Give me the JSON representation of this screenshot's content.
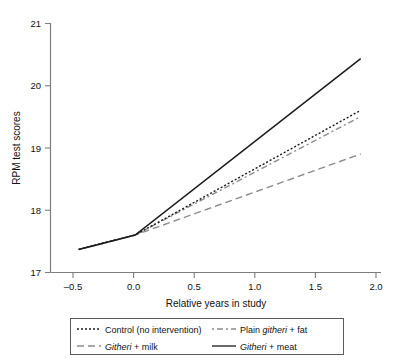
{
  "chart_data": {
    "type": "line",
    "title": "",
    "subtitle": "",
    "xlabel": "Relative years in study",
    "ylabel": "RPM test scores",
    "xlim": [
      -0.75,
      2.18
    ],
    "ylim": [
      17,
      21
    ],
    "xticks": [
      -0.5,
      0.0,
      0.5,
      1.0,
      1.5,
      2.0
    ],
    "xticklabels": [
      "–0.5",
      "0.0",
      "0.5",
      "1.0",
      "1.5",
      "2.0"
    ],
    "yticks": [
      17,
      18,
      19,
      20,
      21
    ],
    "yticklabels": [
      "17",
      "18",
      "19",
      "20",
      "21"
    ],
    "grid": false,
    "legend_position": "below",
    "x": [
      -0.5,
      0.0,
      2.0
    ],
    "series": [
      {
        "name": "Control (no intervention)",
        "values": [
          17.37,
          17.6,
          19.6
        ],
        "style": "dotted",
        "color": "#1a1a1a"
      },
      {
        "name": "Plain githeri + fat",
        "values": [
          17.37,
          17.6,
          19.5
        ],
        "style": "dashdot",
        "color": "#8c8c8c"
      },
      {
        "name": "Githeri + milk",
        "values": [
          17.37,
          17.6,
          18.9
        ],
        "style": "dashed",
        "color": "#8c8c8c"
      },
      {
        "name": "Githeri + meat",
        "values": [
          17.37,
          17.6,
          20.43
        ],
        "style": "solid",
        "color": "#1a1a1a"
      }
    ]
  },
  "axes": {
    "ylabel": "RPM test scores",
    "xlabel": "Relative years in study",
    "yticklabels": [
      "21",
      "20",
      "19",
      "18",
      "17"
    ],
    "xticklabels": [
      "–0.5",
      "0.0",
      "0.5",
      "1.0",
      "1.5",
      "2.0"
    ]
  },
  "legend": {
    "entries": [
      {
        "label_pre": "Control (no intervention)",
        "label_italic": "",
        "label_post": "",
        "style": "dotted",
        "color": "#1a1a1a"
      },
      {
        "label_pre": "Plain ",
        "label_italic": "githeri",
        "label_post": " + fat",
        "style": "dashdot",
        "color": "#8c8c8c"
      },
      {
        "label_pre": "",
        "label_italic": "Githeri",
        "label_post": " + milk",
        "style": "dashed",
        "color": "#8c8c8c"
      },
      {
        "label_pre": "",
        "label_italic": "Githeri",
        "label_post": " + meat",
        "style": "solid",
        "color": "#1a1a1a"
      }
    ]
  },
  "colors": {
    "axis": "#7d7d7d",
    "text": "#111111",
    "solid_black": "#1a1a1a",
    "gray_line": "#8c8c8c",
    "legend_border": "#5a5a5a"
  }
}
